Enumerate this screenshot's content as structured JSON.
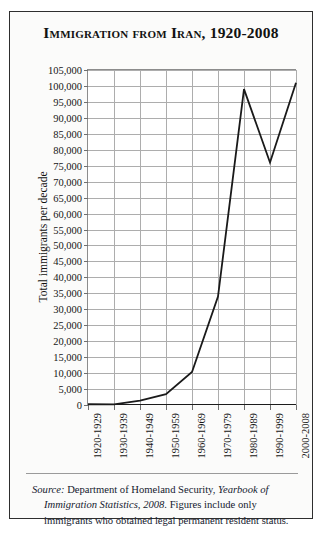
{
  "figure": {
    "title": "Immigration from Iran, 1920-2008",
    "border_color": "#2e2e2e",
    "background": "#fbfbfa"
  },
  "axes": {
    "y_axis_title": "Total immigrants per decade",
    "y_ticks": [
      "105,000",
      "100,000",
      "95,000",
      "90,000",
      "85,000",
      "80,000",
      "75,000",
      "70,000",
      "65,000",
      "60,000",
      "55,000",
      "50,000",
      "45,000",
      "40,000",
      "35,000",
      "30,000",
      "25,000",
      "20,000",
      "15,000",
      "10,000",
      "5,000",
      "0"
    ],
    "x_ticks": [
      "1920-1929",
      "1930-1939",
      "1940-1949",
      "1950-1959",
      "1960-1969",
      "1970-1979",
      "1980-1989",
      "1990-1999",
      "2000-2008"
    ]
  },
  "source_note": {
    "label": "Source:",
    "line1_rest": " Department of Homeland Security, ",
    "line1_italic": "Yearbook of",
    "line2_italic": "Immigration Statistics, 2008",
    "line2_rest": ". Figures include only",
    "line3": "immigrants who obtained legal permanent resident status."
  },
  "chart_data": {
    "type": "line",
    "title": "Immigration from Iran, 1920-2008",
    "xlabel": "",
    "ylabel": "Total immigrants per decade",
    "categories": [
      "1920-1929",
      "1930-1939",
      "1940-1949",
      "1950-1959",
      "1960-1969",
      "1970-1979",
      "1980-1989",
      "1990-1999",
      "2000-2008"
    ],
    "values": [
      241,
      195,
      1380,
      3388,
      10339,
      34000,
      99000,
      76000,
      101000
    ],
    "ylim": [
      0,
      105000
    ],
    "ytick_step": 5000,
    "grid": true,
    "legend": false,
    "line_color": "#1a1a1a",
    "line_width": 1.8
  }
}
